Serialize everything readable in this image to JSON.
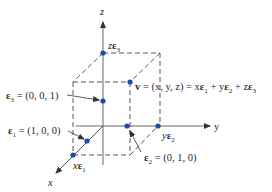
{
  "diagram": {
    "axes": {
      "x_label": "x",
      "y_label": "y",
      "z_label": "z"
    },
    "points": {
      "e1_label": "ε",
      "e1_sub": "1",
      "e1_value": " = (1, 0, 0)",
      "e2_label": "ε",
      "e2_sub": "2",
      "e2_value": " = (0, 1, 0)",
      "e3_label": "ε",
      "e3_sub": "3",
      "e3_value": " = (0, 0, 1)",
      "xe1_prefix": "x",
      "xe1_eps": "ε",
      "xe1_sub": "1",
      "ye2_prefix": "y",
      "ye2_eps": "ε",
      "ye2_sub": "2",
      "ze3_prefix": "z",
      "ze3_eps": "ε",
      "ze3_sub": "3"
    },
    "vector_equation": {
      "v": "v",
      "part1": " = (x, y, z) = x",
      "eps": "ε",
      "sub1": "1",
      "plus_y": " + y",
      "sub2": "2",
      "plus_z": " + z",
      "sub3": "3"
    },
    "colors": {
      "axis": "#555555",
      "dashed": "#444444",
      "dot": "#1f4aa8",
      "text": "#2a2a2a"
    }
  }
}
